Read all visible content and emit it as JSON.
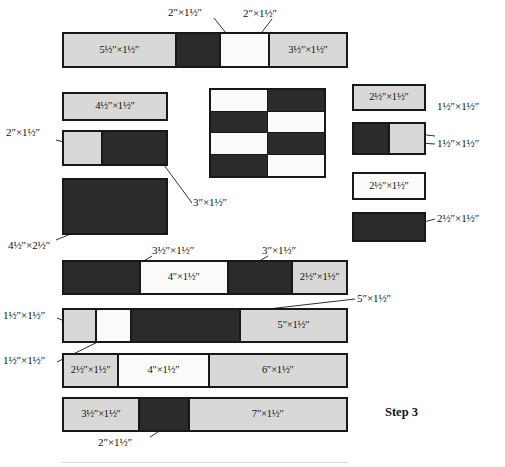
{
  "figure": {
    "step_label": "Step 3",
    "colors": {
      "gray_fabric": "#d8d8d6",
      "white_fabric": "#fbfbfa",
      "dark_fabric": "#2b2b2e",
      "outline": "#18181a",
      "background": "#ffffff",
      "text": "#111111"
    }
  },
  "callouts": {
    "top_left": "2″×1½″",
    "top_right": "2″×1½″",
    "two_by_one_half_left": "2″×1½″",
    "three_by_one_half": "3″×1½″",
    "four_half_by_two_half": "4½″×2½″",
    "three_half_by_one_half": "3½″×1½″",
    "three_by_one_half_b": "3″×1½″",
    "one_half_sq_a": "1½″×1½″",
    "one_half_sq_b": "1½″×1½″",
    "five_by_one_half": "5″×1½″",
    "two_by_one_half_bottom": "2″×1½″",
    "two_by_one_half_crop": "2″×1½″",
    "right_sq_a": "1½″×1½″",
    "right_sq_b": "1½″×1½″",
    "right_dark_rect": "2½″×1½″"
  },
  "strip_top": {
    "segments": [
      {
        "label": "5½″×1½″",
        "fabric": "gray",
        "flex": 99,
        "show_label": true
      },
      {
        "label": "2″×1½″",
        "fabric": "dark",
        "flex": 38,
        "show_label": false
      },
      {
        "label": "2″×1½″",
        "fabric": "white",
        "flex": 42,
        "show_label": false
      },
      {
        "label": "3½″×1½″",
        "fabric": "gray",
        "flex": 68,
        "show_label": true
      }
    ]
  },
  "patch_four_half": {
    "label": "4½″×1½″",
    "fabric": "gray"
  },
  "strip_two_three": {
    "segments": [
      {
        "label": "2″×1½″",
        "fabric": "gray",
        "flex": 40,
        "show_label": false
      },
      {
        "label": "3″×1½″",
        "fabric": "dark",
        "flex": 67,
        "show_label": false
      }
    ]
  },
  "patch_big_dark": {
    "label": "4½″×2½″",
    "fabric": "dark"
  },
  "checkerboard": {
    "rows": 4,
    "cols": 2,
    "cells": [
      [
        "white",
        "dark"
      ],
      [
        "dark",
        "white"
      ],
      [
        "white",
        "dark"
      ],
      [
        "dark",
        "white"
      ]
    ]
  },
  "patch_right_gray": {
    "label": "2½″×1½″",
    "fabric": "gray"
  },
  "strip_right_squares": {
    "segments": [
      {
        "label": "1½″×1½″",
        "fabric": "dark",
        "flex": 1,
        "show_label": false
      },
      {
        "label": "1½″×1½″",
        "fabric": "gray",
        "flex": 1,
        "show_label": false
      }
    ]
  },
  "patch_right_white": {
    "label": "2½″×1½″",
    "fabric": "white"
  },
  "patch_right_dark": {
    "label": "2½″×1½″",
    "fabric": "dark"
  },
  "strip_row1": {
    "segments": [
      {
        "label": "3½″×1½″",
        "fabric": "dark",
        "flex": 68,
        "show_label": false
      },
      {
        "label": "4″×1½″",
        "fabric": "white",
        "flex": 78,
        "show_label": true
      },
      {
        "label": "3″×1½″",
        "fabric": "dark",
        "flex": 57,
        "show_label": false
      },
      {
        "label": "2½″×1½″",
        "fabric": "gray",
        "flex": 48,
        "show_label": true
      }
    ]
  },
  "strip_row2": {
    "segments": [
      {
        "label": "1½″×1½″",
        "fabric": "gray",
        "flex": 30,
        "show_label": false
      },
      {
        "label": "1½″×1½″",
        "fabric": "white",
        "flex": 31,
        "show_label": false
      },
      {
        "label": "5″×1½″",
        "fabric": "dark",
        "flex": 102,
        "show_label": false
      },
      {
        "label": "5″×1½″",
        "fabric": "gray",
        "flex": 100,
        "show_label": true
      }
    ]
  },
  "strip_row3": {
    "segments": [
      {
        "label": "2½″×1½″",
        "fabric": "gray",
        "flex": 50,
        "show_label": true
      },
      {
        "label": "4″×1½″",
        "fabric": "white",
        "flex": 83,
        "show_label": true
      },
      {
        "label": "6″×1½″",
        "fabric": "gray",
        "flex": 128,
        "show_label": true
      }
    ]
  },
  "strip_row4": {
    "segments": [
      {
        "label": "3½″×1½″",
        "fabric": "gray",
        "flex": 70,
        "show_label": true
      },
      {
        "label": "2″×1½″",
        "fabric": "dark",
        "flex": 45,
        "show_label": false
      },
      {
        "label": "7″×1½″",
        "fabric": "gray",
        "flex": 148,
        "show_label": true
      }
    ]
  }
}
